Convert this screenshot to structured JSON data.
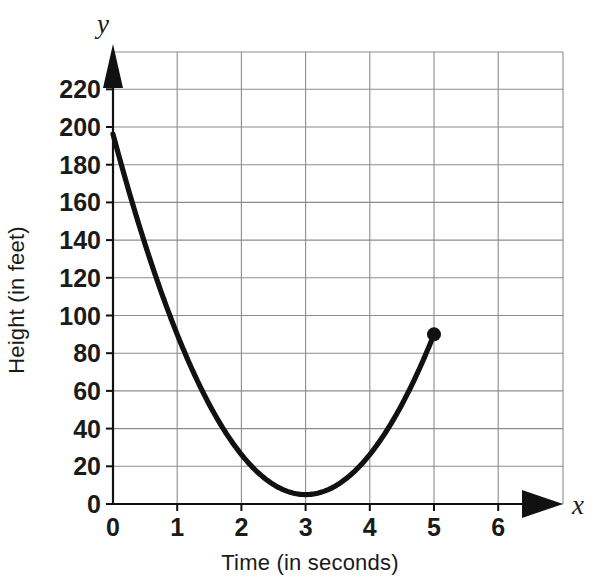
{
  "chart_data": {
    "type": "line",
    "title": "",
    "xlabel": "Time (in seconds)",
    "ylabel": "Height (in feet)",
    "x_axis_variable": "x",
    "y_axis_variable": "y",
    "xlim": [
      0,
      6.5
    ],
    "ylim": [
      0,
      235
    ],
    "xticks": [
      0,
      1,
      2,
      3,
      4,
      5,
      6
    ],
    "xtick_labels": [
      "0",
      "1",
      "2",
      "3",
      "4",
      "5",
      "6"
    ],
    "yticks": [
      0,
      20,
      40,
      60,
      80,
      100,
      120,
      140,
      160,
      180,
      200,
      220
    ],
    "ytick_labels": [
      "0",
      "20",
      "40",
      "60",
      "80",
      "100",
      "120",
      "140",
      "160",
      "180",
      "200",
      "220"
    ],
    "grid": true,
    "grid_color": "#8c8c8c",
    "curve_color": "#111111",
    "legend": "none",
    "series": [
      {
        "name": "Height of object over time",
        "equation": "h = 16t^2 - 96t + 190",
        "x": [
          0,
          0.25,
          0.5,
          0.75,
          1,
          1.25,
          1.5,
          1.75,
          2,
          2.25,
          2.5,
          2.75,
          3,
          3.25,
          3.5,
          3.75,
          4,
          4.25,
          4.5,
          4.75,
          5
        ],
        "values": [
          190,
          167,
          146,
          127,
          110,
          95,
          82,
          71,
          62,
          55,
          50,
          47,
          46,
          47,
          50,
          55,
          62,
          71,
          82,
          95,
          110
        ]
      }
    ],
    "markers": [
      {
        "label": "endpoint",
        "x": 5,
        "y": 90,
        "style": "filled-circle"
      }
    ],
    "annotations": [
      {
        "label": "y-intercept",
        "x": 0,
        "y": 190
      },
      {
        "label": "vertex-minimum",
        "x": 3,
        "y": 5
      }
    ]
  },
  "labels": {
    "x_variable": "x",
    "y_variable": "y",
    "x_axis_title": "Time (in seconds)",
    "y_axis_title": "Height (in feet)"
  }
}
